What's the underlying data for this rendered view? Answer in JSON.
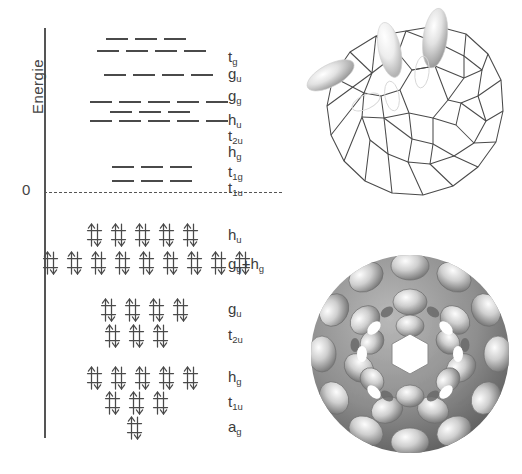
{
  "figure": {
    "kind": "molecular-orbital-energy-level-diagram",
    "molecule": "C60 fullerene"
  },
  "axis": {
    "label": "Energie",
    "zero_tick": "0"
  },
  "chart_data": {
    "type": "energy-level-diagram",
    "title": "",
    "ylabel": "Energie",
    "xlabel": "",
    "grid": false,
    "legend": "none",
    "zero_reference_line": {
      "value": 0,
      "label": "0",
      "style": "dashed"
    },
    "virtual_levels": [
      {
        "term": "t",
        "sub": "g",
        "degeneracy": 3,
        "marks": 3,
        "y": 37,
        "x": 106,
        "occupancy": 0
      },
      {
        "term": "g",
        "sub": "u",
        "degeneracy": 4,
        "marks": 4,
        "y": 49,
        "x": 97,
        "occupancy": 0
      },
      {
        "term": "g",
        "sub": "g",
        "degeneracy": 4,
        "marks": 4,
        "y": 73,
        "x": 104,
        "occupancy": 0
      },
      {
        "term": "h",
        "sub": "u",
        "degeneracy": 5,
        "marks": 5,
        "y": 100,
        "x": 90,
        "occupancy": 0
      },
      {
        "term": "t",
        "sub": "2u",
        "degeneracy": 3,
        "marks": 3,
        "y": 110,
        "x": 110,
        "occupancy": 0
      },
      {
        "term": "h",
        "sub": "g",
        "degeneracy": 5,
        "marks": 5,
        "y": 119,
        "x": 90,
        "occupancy": 0
      },
      {
        "term": "t",
        "sub": "1g",
        "degeneracy": 3,
        "marks": 3,
        "y": 165,
        "x": 112,
        "occupancy": 0
      },
      {
        "term": "t",
        "sub": "1u",
        "degeneracy": 3,
        "marks": 3,
        "y": 179,
        "x": 112,
        "occupancy": 0
      }
    ],
    "occupied_levels": [
      {
        "term": "h",
        "sub": "u",
        "label_html": "h_u",
        "pairs": 5,
        "electrons": 10,
        "y": 222,
        "x": 86
      },
      {
        "term": "g+h",
        "sub": "g",
        "label_html": "g_g+h_g",
        "pairs": 9,
        "electrons": 18,
        "y": 250,
        "x": 42
      },
      {
        "term": "g",
        "sub": "u",
        "label_html": "g_u",
        "pairs": 4,
        "electrons": 8,
        "y": 297,
        "x": 100
      },
      {
        "term": "t",
        "sub": "2u",
        "label_html": "t_2u",
        "pairs": 3,
        "electrons": 6,
        "y": 323,
        "x": 104
      },
      {
        "term": "h",
        "sub": "g",
        "label_html": "h_g",
        "pairs": 5,
        "electrons": 10,
        "y": 365,
        "x": 86
      },
      {
        "term": "t",
        "sub": "1u",
        "label_html": "t_1u",
        "pairs": 3,
        "electrons": 6,
        "y": 390,
        "x": 104
      },
      {
        "term": "a",
        "sub": "g",
        "label_html": "a_g",
        "pairs": 1,
        "electrons": 2,
        "y": 415,
        "x": 126
      }
    ],
    "electron_symbol": "up-down-arrow-pair"
  },
  "virtual_terms": [
    {
      "base": "t",
      "sub": "g",
      "x": 228,
      "y": 49
    },
    {
      "base": "g",
      "sub": "u",
      "x": 228,
      "y": 66
    },
    {
      "base": "g",
      "sub": "g",
      "x": 228,
      "y": 88
    },
    {
      "base": "h",
      "sub": "u",
      "x": 228,
      "y": 112
    },
    {
      "base": "t",
      "sub": "2u",
      "x": 228,
      "y": 128
    },
    {
      "base": "h",
      "sub": "g",
      "x": 228,
      "y": 144
    },
    {
      "base": "t",
      "sub": "1g",
      "x": 228,
      "y": 164
    },
    {
      "base": "t",
      "sub": "1u",
      "x": 228,
      "y": 180
    }
  ],
  "occupied_terms": [
    {
      "base": "h",
      "sub": "u",
      "x": 228,
      "y": 227,
      "plus": false,
      "base2": "",
      "sub2": ""
    },
    {
      "base": "g",
      "sub": "g",
      "x": 228,
      "y": 256,
      "plus": true,
      "base2": "h",
      "sub2": "g"
    },
    {
      "base": "g",
      "sub": "u",
      "x": 228,
      "y": 301,
      "plus": false,
      "base2": "",
      "sub2": ""
    },
    {
      "base": "t",
      "sub": "2u",
      "x": 228,
      "y": 327,
      "plus": false,
      "base2": "",
      "sub2": ""
    },
    {
      "base": "h",
      "sub": "g",
      "x": 228,
      "y": 369,
      "plus": false,
      "base2": "",
      "sub2": ""
    },
    {
      "base": "t",
      "sub": "1u",
      "x": 228,
      "y": 394,
      "plus": false,
      "base2": "",
      "sub2": ""
    },
    {
      "base": "a",
      "sub": "g",
      "x": 228,
      "y": 419,
      "plus": false,
      "base2": "",
      "sub2": ""
    }
  ],
  "graphics": {
    "cage": {
      "name": "fullerene-cage-wireframe",
      "description": "C60 truncated icosahedron wireframe with p-orbital lobes",
      "orbital_lobe_count": 3,
      "line_color": "#4a4a4a",
      "lobe_color": "#d8d8d8"
    },
    "density": {
      "name": "electron-density-isosurface",
      "description": "grayscale electron density isosurface of C60",
      "base_color": "#8a8a8a",
      "highlight_color": "#f2f2f2"
    }
  }
}
